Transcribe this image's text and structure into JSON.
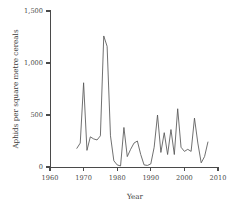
{
  "chart_data": {
    "type": "line",
    "title": "",
    "subtitle": "",
    "xlabel": "Year",
    "ylabel": "Aphids per square metre cereals",
    "xlim": [
      1960,
      2010
    ],
    "ylim": [
      0,
      1500
    ],
    "xticks": [
      1960,
      1970,
      1980,
      1990,
      2000,
      2010
    ],
    "xticklabels": [
      "1960",
      "1970",
      "1980",
      "1990",
      "2000",
      "2010"
    ],
    "yticks": [
      0,
      500,
      1000,
      1500
    ],
    "yticklabels": [
      "0",
      "500",
      "1,000",
      "1,500"
    ],
    "grid": false,
    "legend": null,
    "series": [
      {
        "name": "Aphids per square metre cereals",
        "color": "#565656",
        "x": [
          1968,
          1969,
          1970,
          1971,
          1972,
          1973,
          1974,
          1975,
          1976,
          1977,
          1978,
          1979,
          1980,
          1981,
          1982,
          1983,
          1984,
          1985,
          1986,
          1987,
          1988,
          1989,
          1990,
          1991,
          1992,
          1993,
          1994,
          1995,
          1996,
          1997,
          1998,
          1999,
          2000,
          2001,
          2002,
          2003,
          2004,
          2005,
          2006,
          2007
        ],
        "values": [
          180,
          230,
          810,
          160,
          290,
          270,
          260,
          300,
          1260,
          1160,
          300,
          60,
          20,
          10,
          380,
          100,
          170,
          230,
          250,
          120,
          20,
          15,
          30,
          190,
          500,
          140,
          330,
          120,
          360,
          120,
          560,
          190,
          150,
          170,
          150,
          470,
          230,
          40,
          100,
          240
        ]
      }
    ]
  },
  "axis_labels": {
    "y_axis_title": "Aphids per square metre cereals",
    "x_axis_title": "Year"
  },
  "colors": {
    "line": "#565656",
    "axis": "#4a4a4a",
    "background": "#ffffff",
    "text": "#3a3a3a"
  }
}
